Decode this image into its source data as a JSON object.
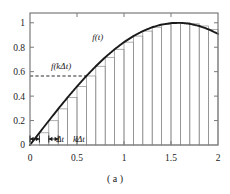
{
  "figure": {
    "caption": "( a )",
    "curve_label": "f(t)",
    "sample_label": "f(kΔt)",
    "delta_label": "Δt",
    "k_delta_label": "kΔt",
    "colors": {
      "curve": "#1a1a1a",
      "bars": "#8c8c8c",
      "axis": "#7a7a7a",
      "dashed": "#2b2b2b",
      "background": "#ffffff",
      "text": "#1a1a1a"
    }
  },
  "chart_data": {
    "type": "area",
    "title": "",
    "subtitle": "",
    "xlabel": "",
    "ylabel": "",
    "xlim": [
      0,
      2
    ],
    "ylim": [
      0,
      1.08
    ],
    "grid": false,
    "legend": null,
    "x_ticks": [
      0,
      0.5,
      1,
      1.5,
      2
    ],
    "x_tick_labels": [
      "0",
      "0.5",
      "1",
      "1.5",
      "2"
    ],
    "y_ticks": [
      0,
      0.2,
      0.4,
      0.6,
      0.8,
      1
    ],
    "y_tick_labels": [
      "0",
      "0.2",
      "0.4",
      "0.6",
      "0.8",
      "1"
    ],
    "series": [
      {
        "name": "f(t)",
        "type": "line",
        "description": "smooth sinusoidal curve rising from 0 at t=0 to peak 1.0 near t=1.57 then falling to about 0.91 at t=2",
        "x": [
          0,
          0.1,
          0.2,
          0.3,
          0.4,
          0.5,
          0.6,
          0.7,
          0.8,
          0.9,
          1.0,
          1.1,
          1.2,
          1.3,
          1.4,
          1.5,
          1.6,
          1.7,
          1.8,
          1.9,
          2.0
        ],
        "y": [
          0,
          0.0998,
          0.1987,
          0.2955,
          0.3894,
          0.4794,
          0.5646,
          0.6442,
          0.7174,
          0.7833,
          0.8415,
          0.8912,
          0.932,
          0.9636,
          0.9854,
          0.9975,
          0.9996,
          0.9917,
          0.9738,
          0.9463,
          0.9093
        ]
      },
      {
        "name": "rectangles",
        "type": "bar",
        "description": "inscribed rectangles of width 0.1 whose height equals f at the left edge of each interval",
        "bar_width": 0.1,
        "bar_left_edges": [
          0.1,
          0.2,
          0.3,
          0.4,
          0.5,
          0.6,
          0.7,
          0.8,
          0.9,
          1.0,
          1.1,
          1.2,
          1.3,
          1.4,
          1.5,
          1.6,
          1.7,
          1.8,
          1.9
        ],
        "bar_heights": [
          0.0998,
          0.1987,
          0.2955,
          0.3894,
          0.4794,
          0.5646,
          0.6442,
          0.7174,
          0.7833,
          0.8415,
          0.8912,
          0.932,
          0.9636,
          0.9854,
          0.9975,
          0.9996,
          0.9917,
          0.9738,
          0.9463
        ]
      }
    ],
    "annotations": [
      {
        "name": "curve-label",
        "text": "f(t)",
        "x": 0.72,
        "y": 0.86
      },
      {
        "name": "sample-label",
        "text": "f(kΔt)",
        "x": 0.33,
        "y": 0.625
      },
      {
        "name": "delta-t-label",
        "text": "Δt",
        "x": 0.32,
        "y": -0.055
      },
      {
        "name": "k-delta-t-label",
        "text": "kΔt",
        "x": 0.52,
        "y": -0.055
      }
    ],
    "reference_lines": [
      {
        "name": "f-k-delta-t-dashed",
        "orientation": "horizontal",
        "value": 0.5646,
        "style": "dashed",
        "from_x": 0.0,
        "to_x": 0.6
      }
    ]
  }
}
